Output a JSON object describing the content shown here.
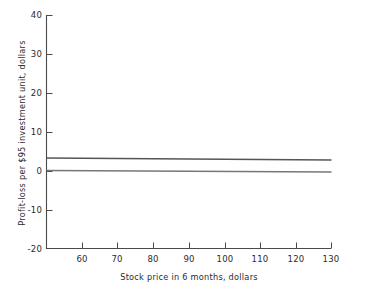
{
  "chart_data": {
    "type": "line",
    "title": "",
    "xlabel": "Stock price in 6 months, dollars",
    "ylabel": "Profit-loss per $95 investment unit, dollars",
    "xlim": [
      52,
      130
    ],
    "ylim": [
      -20,
      40
    ],
    "xticks": [
      60,
      70,
      80,
      90,
      100,
      110,
      120,
      130
    ],
    "yticks": [
      40,
      30,
      20,
      10,
      0,
      -10,
      -20
    ],
    "xtick_labels": [
      "60",
      "70",
      "80",
      "90",
      "100",
      "110",
      "120",
      "130"
    ],
    "ytick_labels": [
      "40",
      "30",
      "20",
      "10",
      "0",
      "-10",
      "-20"
    ],
    "grid": false,
    "legend": "none",
    "series": [
      {
        "name": "upper-line",
        "color": "#555555",
        "x": [
          52,
          130
        ],
        "values": [
          3.3,
          2.8
        ]
      },
      {
        "name": "lower-line",
        "color": "#777777",
        "x": [
          52,
          130
        ],
        "values": [
          0.1,
          -0.3
        ]
      }
    ]
  },
  "axes": {
    "spine_color": "#4a4a4a",
    "tick_color": "#4a4a4a"
  }
}
